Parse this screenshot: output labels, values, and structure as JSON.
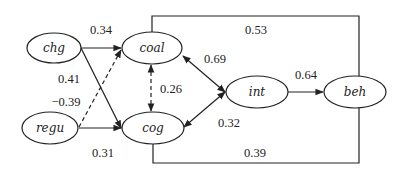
{
  "nodes": [
    {
      "id": "chg",
      "label": "chg",
      "cx": 54,
      "cy": 48,
      "rx": 27,
      "ry": 15
    },
    {
      "id": "coal",
      "label": "coal",
      "cx": 152,
      "cy": 48,
      "rx": 30,
      "ry": 16
    },
    {
      "id": "regu",
      "label": "regu",
      "cx": 50,
      "cy": 128,
      "rx": 28,
      "ry": 16
    },
    {
      "id": "cog",
      "label": "cog",
      "cx": 153,
      "cy": 128,
      "rx": 31,
      "ry": 16
    },
    {
      "id": "int",
      "label": "int",
      "cx": 257,
      "cy": 92,
      "rx": 31,
      "ry": 16
    },
    {
      "id": "beh",
      "label": "beh",
      "cx": 355,
      "cy": 92,
      "rx": 31,
      "ry": 16
    }
  ],
  "edges": [
    {
      "from": "chg",
      "to": "coal",
      "coef": "0.34",
      "style": "solid",
      "type": "directed"
    },
    {
      "from": "chg",
      "to": "cog",
      "coef": "0.41",
      "style": "solid",
      "type": "directed"
    },
    {
      "from": "regu",
      "to": "coal",
      "coef": "−0.39",
      "style": "dashed",
      "type": "directed"
    },
    {
      "from": "regu",
      "to": "cog",
      "coef": "0.31",
      "style": "solid",
      "type": "directed"
    },
    {
      "from": "coal",
      "to": "cog",
      "coef": "0.26",
      "style": "dashed",
      "type": "bidirectional"
    },
    {
      "from": "coal",
      "to": "int",
      "coef": "0.69",
      "style": "solid",
      "type": "bidirectional"
    },
    {
      "from": "cog",
      "to": "int",
      "coef": "0.32",
      "style": "solid",
      "type": "bidirectional"
    },
    {
      "from": "int",
      "to": "beh",
      "coef": "0.64",
      "style": "solid",
      "type": "directed"
    },
    {
      "from": "coal",
      "to": "beh",
      "coef": "0.53",
      "style": "solid",
      "type": "connector-top"
    },
    {
      "from": "cog",
      "to": "beh",
      "coef": "0.39",
      "style": "solid",
      "type": "connector-bottom"
    }
  ],
  "labels": {
    "chg": "chg",
    "coal": "coal",
    "regu": "regu",
    "cog": "cog",
    "int": "int",
    "beh": "beh",
    "c_chg_coal": "0.34",
    "c_chg_cog": "0.41",
    "c_regu_coal": "−0.39",
    "c_regu_cog": "0.31",
    "c_coal_cog": "0.26",
    "c_coal_int": "0.69",
    "c_cog_int": "0.32",
    "c_int_beh": "0.64",
    "c_coal_beh": "0.53",
    "c_cog_beh": "0.39"
  }
}
